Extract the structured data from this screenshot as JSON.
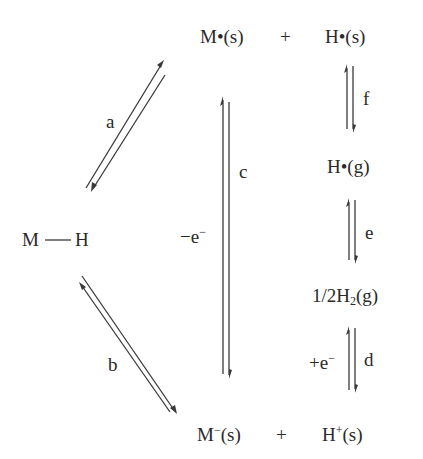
{
  "species": {
    "mh_left": "M",
    "mh_right": "H",
    "m_radical": "M•(s)",
    "plus_top": "+",
    "h_radical_s": "H•(s)",
    "h_radical_g": "H•(g)",
    "h2_prefix": "1/2H",
    "h2_sub": "2",
    "h2_suffix": "(g)",
    "m_anion_base": "M",
    "m_anion_sup": "−",
    "m_anion_phase": "(s)",
    "plus_bottom": "+",
    "h_cation_base": "H",
    "h_cation_sup": "+",
    "h_cation_phase": "(s)"
  },
  "steps": {
    "a": "a",
    "b": "b",
    "c": "c",
    "d": "d",
    "e": "e",
    "f": "f"
  },
  "electron_labels": {
    "c_prefix": "−e",
    "c_sup": "−",
    "d_prefix": "+e",
    "d_sup": "−"
  }
}
